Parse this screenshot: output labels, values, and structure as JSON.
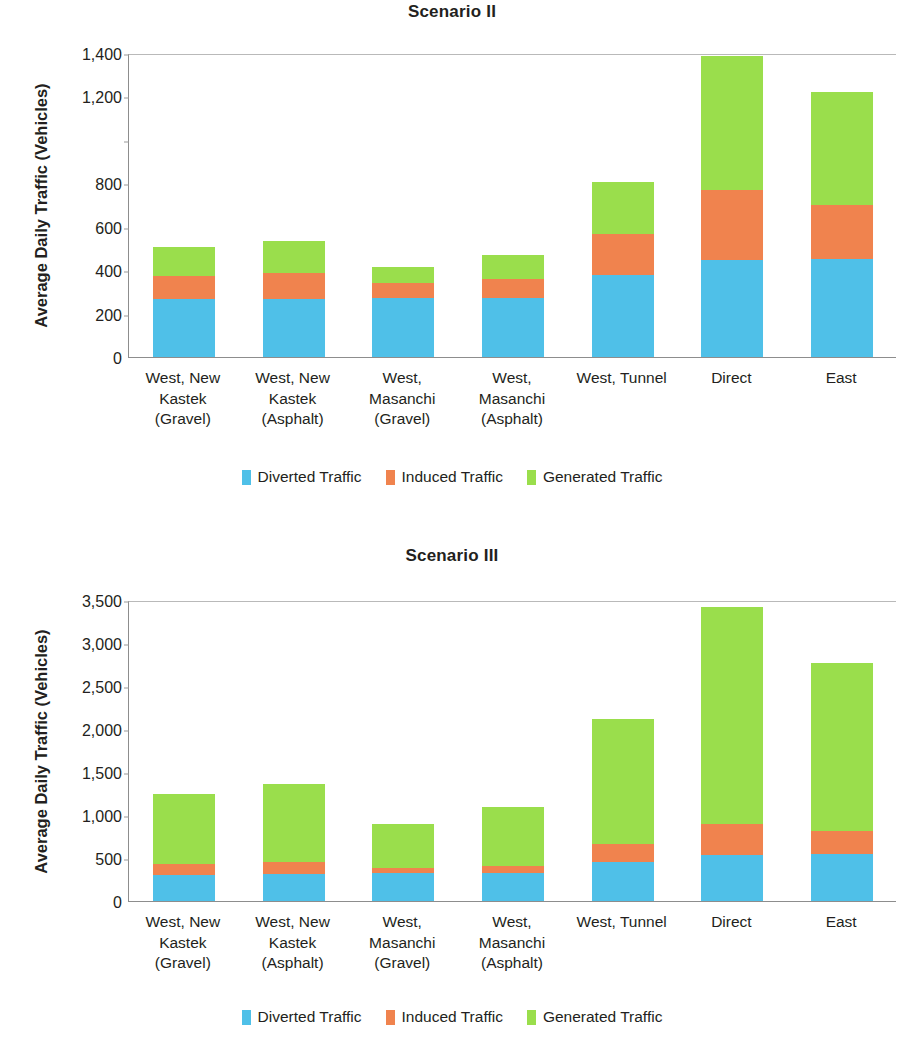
{
  "colors": {
    "diverted": "#4FC0E8",
    "induced": "#F0834E",
    "generated": "#9ADE4C",
    "axis": "#8d8d8d",
    "text": "#231f20"
  },
  "legend": {
    "items": [
      {
        "label": "Diverted Traffic",
        "color_key": "diverted"
      },
      {
        "label": "Induced Traffic",
        "color_key": "induced"
      },
      {
        "label": "Generated Traffic",
        "color_key": "generated"
      }
    ]
  },
  "figures": [
    {
      "id": "figure-scenario-2",
      "title": "Scenario II",
      "chart_index": 0
    },
    {
      "id": "figure-scenario-3",
      "title": "Scenario III",
      "chart_index": 1
    }
  ],
  "chart_data": [
    {
      "type": "bar",
      "stacked": true,
      "title": "Scenario II",
      "xlabel": "",
      "ylabel": "Average Daily Traffic (Vehicles)",
      "ylim": [
        0,
        1400
      ],
      "ytick_step": 200,
      "ytick_labels": [
        "0",
        "200",
        "400",
        "600",
        "800",
        "",
        "1,200",
        "1,400"
      ],
      "ytick_values": [
        0,
        200,
        400,
        600,
        800,
        1000,
        1200,
        1400
      ],
      "grid": false,
      "legend_position": "bottom",
      "categories": [
        "West, New\nKastek\n(Gravel)",
        "West, New\nKastek\n(Asphalt)",
        "West,\nMasanchi\n(Gravel)",
        "West,\nMasanchi\n(Asphalt)",
        "West, Tunnel",
        "Direct",
        "East"
      ],
      "category_lines": [
        [
          "West, New",
          "Kastek",
          "(Gravel)"
        ],
        [
          "West, New",
          "Kastek",
          "(Asphalt)"
        ],
        [
          "West,",
          "Masanchi",
          "(Gravel)"
        ],
        [
          "West,",
          "Masanchi",
          "(Asphalt)"
        ],
        [
          "West, Tunnel"
        ],
        [
          "Direct"
        ],
        [
          "East"
        ]
      ],
      "series": [
        {
          "name": "Diverted Traffic",
          "color_key": "diverted",
          "values": [
            265,
            265,
            270,
            270,
            380,
            445,
            450
          ]
        },
        {
          "name": "Induced Traffic",
          "color_key": "induced",
          "values": [
            110,
            120,
            70,
            90,
            185,
            325,
            250
          ]
        },
        {
          "name": "Generated Traffic",
          "color_key": "generated",
          "values": [
            130,
            150,
            75,
            110,
            240,
            615,
            520
          ]
        }
      ],
      "totals": [
        505,
        535,
        415,
        470,
        805,
        1385,
        1220
      ]
    },
    {
      "type": "bar",
      "stacked": true,
      "title": "Scenario III",
      "xlabel": "",
      "ylabel": "Average Daily Traffic (Vehicles)",
      "ylim": [
        0,
        3500
      ],
      "ytick_step": 500,
      "ytick_labels": [
        "0",
        "500",
        "1,000",
        "1,500",
        "2,000",
        "2,500",
        "3,000",
        "3,500"
      ],
      "ytick_values": [
        0,
        500,
        1000,
        1500,
        2000,
        2500,
        3000,
        3500
      ],
      "grid": false,
      "legend_position": "bottom",
      "categories": [
        "West, New\nKastek\n(Gravel)",
        "West, New\nKastek\n(Asphalt)",
        "West,\nMasanchi\n(Gravel)",
        "West,\nMasanchi\n(Asphalt)",
        "West, Tunnel",
        "Direct",
        "East"
      ],
      "category_lines": [
        [
          "West, New",
          "Kastek",
          "(Gravel)"
        ],
        [
          "West, New",
          "Kastek",
          "(Asphalt)"
        ],
        [
          "West,",
          "Masanchi",
          "(Gravel)"
        ],
        [
          "West,",
          "Masanchi",
          "(Asphalt)"
        ],
        [
          "West, Tunnel"
        ],
        [
          "Direct"
        ],
        [
          "East"
        ]
      ],
      "series": [
        {
          "name": "Diverted Traffic",
          "color_key": "diverted",
          "values": [
            300,
            310,
            320,
            325,
            450,
            540,
            545
          ]
        },
        {
          "name": "Induced Traffic",
          "color_key": "induced",
          "values": [
            130,
            140,
            65,
            85,
            215,
            360,
            275
          ]
        },
        {
          "name": "Generated Traffic",
          "color_key": "generated",
          "values": [
            810,
            905,
            510,
            685,
            1455,
            2520,
            1950
          ]
        }
      ],
      "totals": [
        1240,
        1355,
        895,
        1095,
        2120,
        3420,
        2770
      ]
    }
  ]
}
